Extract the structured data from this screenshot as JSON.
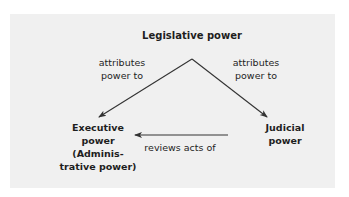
{
  "diagram": {
    "colors": {
      "background": "#ffffff",
      "panel": "#f0f0f0",
      "text": "#1e1e1e",
      "arrow": "#333333"
    },
    "nodes": {
      "legislative": {
        "lines": [
          "Legislative power"
        ]
      },
      "executive": {
        "lines": [
          "Executive",
          "power",
          "(Adminis-",
          "trative power)"
        ]
      },
      "judicial": {
        "lines": [
          "Judicial",
          "power"
        ]
      }
    },
    "edges": [
      {
        "from": "legislative",
        "to": "executive",
        "label_lines": [
          "attributes",
          "power to"
        ]
      },
      {
        "from": "legislative",
        "to": "judicial",
        "label_lines": [
          "attributes",
          "power to"
        ]
      },
      {
        "from": "judicial",
        "to": "executive",
        "label_lines": [
          "reviews acts of"
        ]
      }
    ]
  }
}
